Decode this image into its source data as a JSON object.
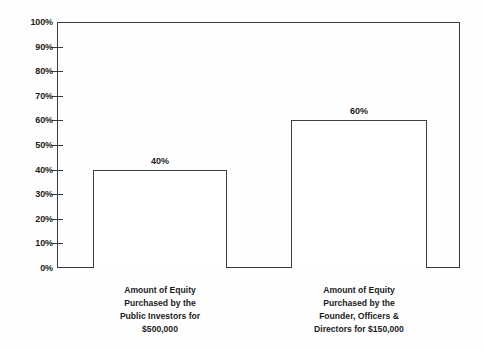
{
  "chart_data": {
    "type": "bar",
    "title": "",
    "subtitle": "",
    "xlabel": "",
    "ylabel": "",
    "ylim": [
      0,
      100
    ],
    "grid": false,
    "legend": false,
    "legend_position": "none",
    "categories": [
      "Amount of Equity Purchased by the Public Investors for $500,000",
      "Amount of Equity Purchased by the Founder, Officers & Directors for $150,000"
    ],
    "category_lines": [
      [
        "Amount of Equity",
        "Purchased by the",
        "Public Investors for",
        "$500,000"
      ],
      [
        "Amount of Equity",
        "Purchased by the",
        "Founder, Officers &",
        "Directors for $150,000"
      ]
    ],
    "values": [
      40,
      60
    ],
    "value_labels": [
      "40%",
      "60%"
    ],
    "y_ticks": [
      0,
      10,
      20,
      30,
      40,
      50,
      60,
      70,
      80,
      90,
      100
    ],
    "y_tick_labels": [
      "0%",
      "10%",
      "20%",
      "30%",
      "40%",
      "50%",
      "60%",
      "70%",
      "80%",
      "90%",
      "100%"
    ],
    "colors": {
      "bar_fill": "#ffffff",
      "bar_stroke": "#3f3f3f",
      "axis": "#3a3a3a",
      "text": "#1c1c1c",
      "background": "#fefefe"
    }
  }
}
